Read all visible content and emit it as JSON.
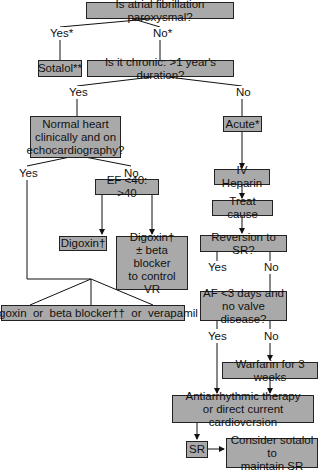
{
  "nodes": {
    "paroxysmal": "Is atrial fibrillation paroxysmal?",
    "sotalol": "Sotalol**",
    "chronic": "Is it chronic: >1 year's duration?",
    "normal_heart": "Normal heart\nclinically and on\nechocardiography?",
    "acute": "Acute*",
    "ef": "EF <40: >40",
    "iv_heparin": "IV Heparin",
    "treat_cause": "Treat cause",
    "digoxin": "Digoxin†",
    "digoxin_beta": "Digoxin†\n± beta blocker\nto control\nVR",
    "reversion": "Reversion to SR?",
    "af_3days": "AF <3 days and\nno valve disease?",
    "digoxin_or": "Digoxin  or  beta blocker††  or  verapamil",
    "warfarin": "Warfarin for 3 weeks",
    "antiarrhythmic": "Antiarrhythmic therapy\nor direct current cardioversion",
    "sr": "SR",
    "consider_sotalol": "Consider sotalol to\nmaintain SR"
  },
  "labels": {
    "parox_yes": "Yes*",
    "parox_no": "No*",
    "chronic_yes": "Yes",
    "chronic_no": "No",
    "normal_yes": "Yes",
    "normal_no": "No",
    "reversion_yes": "Yes",
    "reversion_no": "No",
    "af_yes": "Yes",
    "af_no": "No"
  }
}
